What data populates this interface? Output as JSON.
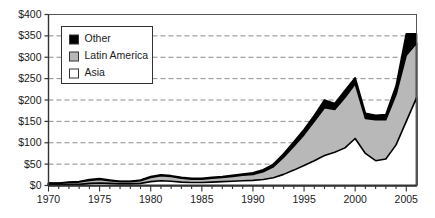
{
  "chart_data": {
    "type": "area",
    "title": "",
    "xlabel": "",
    "ylabel": "",
    "stacked": true,
    "grid": true,
    "grid_style": "dashed-horizontal",
    "legend_position": "top-left-inside",
    "xlim": [
      1970,
      2006
    ],
    "ylim": [
      0,
      400
    ],
    "ytick_values": [
      0,
      50,
      100,
      150,
      200,
      250,
      300,
      350,
      400
    ],
    "ytick_labels": [
      "$0",
      "$50",
      "$100",
      "$150",
      "$200",
      "$250",
      "$300",
      "$350",
      "$400"
    ],
    "xtick_labels": [
      "1970",
      "1975",
      "1980",
      "1985",
      "1990",
      "1995",
      "2000",
      "2005"
    ],
    "xtick_values": [
      1970,
      1975,
      1980,
      1985,
      1990,
      1995,
      2000,
      2005
    ],
    "minor_xticks_every": 1,
    "x": [
      1970,
      1971,
      1972,
      1973,
      1974,
      1975,
      1976,
      1977,
      1978,
      1979,
      1980,
      1981,
      1982,
      1983,
      1984,
      1985,
      1986,
      1987,
      1988,
      1989,
      1990,
      1991,
      1992,
      1993,
      1994,
      1995,
      1996,
      1997,
      1998,
      1999,
      2000,
      2001,
      2002,
      2003,
      2004,
      2005,
      2006
    ],
    "series": [
      {
        "name": "Asia",
        "color": "#ffffff",
        "values": [
          2,
          2,
          3,
          3,
          5,
          6,
          5,
          4,
          4,
          5,
          9,
          11,
          10,
          8,
          7,
          7,
          8,
          9,
          10,
          11,
          12,
          14,
          18,
          26,
          36,
          47,
          58,
          70,
          78,
          88,
          110,
          75,
          58,
          62,
          95,
          150,
          205
        ]
      },
      {
        "name": "Latin America",
        "color": "#b8b8b8",
        "values": [
          3,
          3,
          4,
          5,
          7,
          8,
          6,
          5,
          5,
          6,
          10,
          12,
          11,
          9,
          8,
          8,
          9,
          10,
          11,
          13,
          14,
          18,
          26,
          40,
          56,
          72,
          92,
          112,
          100,
          118,
          128,
          82,
          96,
          92,
          118,
          155,
          128
        ]
      },
      {
        "name": "Other",
        "color": "#000000",
        "values": [
          1,
          1,
          1,
          1,
          2,
          2,
          2,
          1,
          1,
          2,
          2,
          2,
          2,
          2,
          2,
          2,
          2,
          2,
          3,
          3,
          4,
          5,
          6,
          8,
          10,
          12,
          14,
          18,
          14,
          16,
          14,
          12,
          10,
          12,
          20,
          50,
          22
        ]
      }
    ],
    "totals": [
      6,
      6,
      8,
      9,
      14,
      16,
      13,
      10,
      10,
      13,
      21,
      25,
      23,
      19,
      17,
      17,
      19,
      21,
      24,
      27,
      30,
      37,
      50,
      74,
      102,
      131,
      164,
      200,
      192,
      222,
      252,
      169,
      164,
      166,
      233,
      355,
      355
    ]
  },
  "legend": {
    "items": [
      {
        "label": "Other",
        "swatch": "#000000"
      },
      {
        "label": "Latin America",
        "swatch": "#b8b8b8"
      },
      {
        "label": "Asia",
        "swatch": "#ffffff"
      }
    ]
  }
}
